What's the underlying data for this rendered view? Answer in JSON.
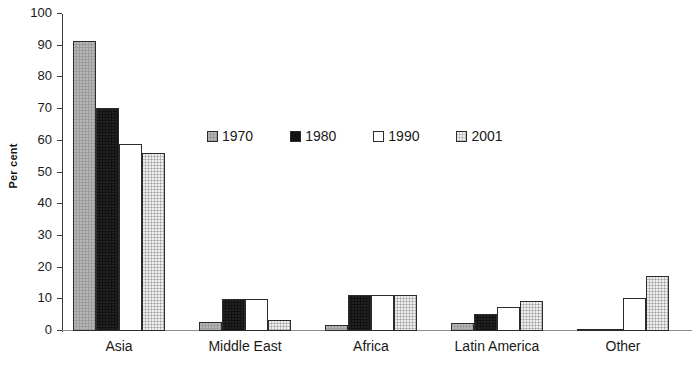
{
  "chart_data": {
    "type": "bar",
    "title": "",
    "subtitle": "",
    "xlabel": "",
    "ylabel": "Per cent",
    "ylim": [
      0,
      100
    ],
    "ytick_step": 10,
    "yticks": [
      100,
      90,
      80,
      70,
      60,
      50,
      40,
      30,
      20,
      10,
      0
    ],
    "grid": false,
    "legend_position": "inside-upper-center",
    "categories": [
      "Asia",
      "Middle East",
      "Africa",
      "Latin America",
      "Other"
    ],
    "series": [
      {
        "name": "1970",
        "color": "#9b9b9b",
        "values": [
          91.5,
          3.0,
          2.0,
          2.5,
          0.3
        ]
      },
      {
        "name": "1980",
        "color": "#121212",
        "values": [
          70.5,
          10.2,
          11.4,
          5.5,
          0.7
        ]
      },
      {
        "name": "1990",
        "color": "#ffffff",
        "values": [
          59.0,
          10.2,
          11.4,
          7.5,
          10.4
        ]
      },
      {
        "name": "2001",
        "color": "#c2c2c2",
        "values": [
          56.0,
          3.5,
          11.4,
          9.5,
          17.3
        ]
      }
    ]
  },
  "legend": {
    "items": [
      {
        "label": "1970"
      },
      {
        "label": "1980"
      },
      {
        "label": "1990"
      },
      {
        "label": "2001"
      }
    ]
  }
}
